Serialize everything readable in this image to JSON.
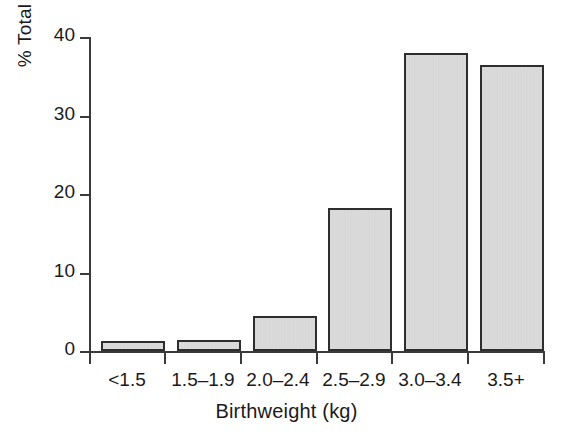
{
  "chart_data": {
    "type": "bar",
    "title": "",
    "subtitle": "",
    "xlabel": "Birthweight (kg)",
    "ylabel": "% Total births",
    "categories": [
      "<1.5",
      "1.5–1.9",
      "2.0–2.4",
      "2.5–2.9",
      "3.0–3.4",
      "3.5+"
    ],
    "values": [
      1.3,
      1.4,
      4.5,
      18.1,
      37.8,
      36.3
    ],
    "ylim": [
      0,
      40
    ],
    "yticks": [
      0,
      10,
      20,
      30,
      40
    ],
    "ytick_labels": [
      "0",
      "10",
      "20",
      "30",
      "40"
    ],
    "grid": false,
    "legend": null,
    "legend_position": "none",
    "annotations": [],
    "series": [
      {
        "name": "% Total births",
        "values": [
          1.3,
          1.4,
          4.5,
          18.1,
          37.8,
          36.3
        ]
      }
    ]
  },
  "style": {
    "background": "#ffffff",
    "bar_fill": "#dedede",
    "bar_edge": "#2e2e2e",
    "axis_color": "#3a3a3a",
    "text_color": "#1a1a1a"
  }
}
